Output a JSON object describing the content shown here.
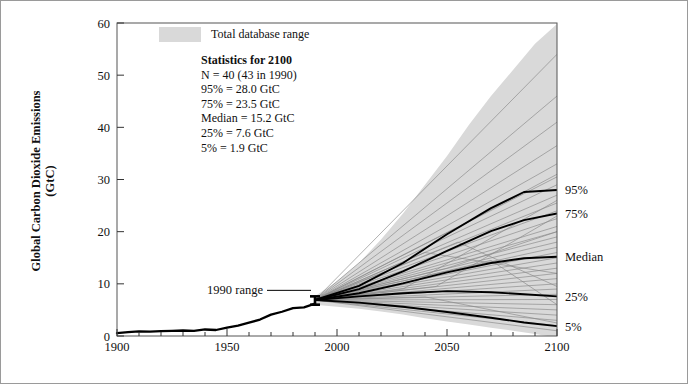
{
  "figure": {
    "name": "global-co2-emissions-scenarios",
    "background": "#ffffff",
    "border_color": "#9a9a9a"
  },
  "legend": {
    "swatch_color": "#d9d9d9",
    "label": "Total database range"
  },
  "stats_box": {
    "heading": "Statistics for 2100",
    "lines": [
      "N = 40  (43 in 1990)",
      "95% = 28.0 GtC",
      "75% = 23.5 GtC",
      "Median = 15.2 GtC",
      "25% = 7.6 GtC",
      "5% = 1.9 GtC"
    ]
  },
  "annotations": [
    {
      "name": "range-1990",
      "text": "1990 range",
      "x_year": 1990,
      "y_low": 6.0,
      "y_high": 7.6
    }
  ],
  "right_labels": [
    {
      "name": "label-95",
      "text": "95%",
      "value": 28.0
    },
    {
      "name": "label-75",
      "text": "75%",
      "value": 23.5
    },
    {
      "name": "label-median",
      "text": "Median",
      "value": 15.2
    },
    {
      "name": "label-25",
      "text": "25%",
      "value": 7.6
    },
    {
      "name": "label-5",
      "text": "5%",
      "value": 1.9
    }
  ],
  "chart_data": {
    "type": "line",
    "title": "",
    "xlabel": "",
    "ylabel_line1": "Global Carbon Dioxide Emissions",
    "ylabel_line2": "(GtC)",
    "xlim": [
      1900,
      2100
    ],
    "ylim": [
      0,
      60
    ],
    "xticks": [
      1900,
      1950,
      2000,
      2050,
      2100
    ],
    "xticks_minor_step": 10,
    "yticks": [
      0,
      10,
      20,
      30,
      40,
      50,
      60
    ],
    "grid": false,
    "legend_position": "top-left-inside",
    "colors": {
      "range_band": "#d9d9d9",
      "historical": "#000000",
      "percentile": "#000000",
      "scenario": "#8a8a8a"
    },
    "series": [
      {
        "name": "Historical emissions",
        "style": "bold-black",
        "x": [
          1900,
          1905,
          1910,
          1915,
          1920,
          1925,
          1930,
          1935,
          1940,
          1945,
          1950,
          1955,
          1960,
          1965,
          1970,
          1975,
          1980,
          1985,
          1990
        ],
        "values": [
          0.55,
          0.75,
          0.88,
          0.85,
          0.95,
          1.0,
          1.05,
          1.0,
          1.25,
          1.15,
          1.6,
          2.0,
          2.55,
          3.15,
          4.1,
          4.65,
          5.35,
          5.5,
          6.2
        ]
      },
      {
        "name": "Total database range upper envelope",
        "style": "band-upper",
        "x": [
          1990,
          2000,
          2010,
          2020,
          2030,
          2040,
          2050,
          2060,
          2070,
          2080,
          2090,
          2100
        ],
        "values": [
          7.6,
          10.5,
          14.0,
          18.5,
          23.5,
          29.0,
          34.5,
          40.5,
          46.0,
          51.0,
          56.0,
          59.8
        ]
      },
      {
        "name": "Total database range lower envelope",
        "style": "band-lower",
        "x": [
          1990,
          2000,
          2010,
          2020,
          2030,
          2040,
          2050,
          2060,
          2070,
          2080,
          2090,
          2100
        ],
        "values": [
          6.0,
          5.6,
          5.2,
          4.7,
          4.1,
          3.4,
          2.8,
          2.2,
          1.6,
          1.0,
          0.4,
          -0.3
        ]
      },
      {
        "name": "95th percentile",
        "style": "bold-black",
        "x": [
          1990,
          2010,
          2030,
          2050,
          2070,
          2085,
          2100
        ],
        "values": [
          6.9,
          9.6,
          14.0,
          19.5,
          24.5,
          27.6,
          28.0
        ]
      },
      {
        "name": "75th percentile",
        "style": "bold-black",
        "x": [
          1990,
          2010,
          2030,
          2050,
          2070,
          2085,
          2100
        ],
        "values": [
          6.9,
          9.0,
          12.4,
          16.3,
          20.1,
          22.2,
          23.5
        ]
      },
      {
        "name": "Median",
        "style": "bold-black",
        "x": [
          1990,
          2010,
          2030,
          2050,
          2070,
          2085,
          2100
        ],
        "values": [
          6.9,
          8.2,
          10.1,
          12.2,
          14.0,
          14.9,
          15.2
        ]
      },
      {
        "name": "25th percentile",
        "style": "bold-black",
        "x": [
          1990,
          2010,
          2030,
          2050,
          2070,
          2085,
          2100
        ],
        "values": [
          6.9,
          7.6,
          8.2,
          8.6,
          8.4,
          8.0,
          7.6
        ]
      },
      {
        "name": "5th percentile",
        "style": "bold-black",
        "x": [
          1990,
          2010,
          2030,
          2050,
          2070,
          2085,
          2100
        ],
        "values": [
          6.9,
          6.4,
          5.6,
          4.6,
          3.5,
          2.6,
          1.9
        ]
      },
      {
        "name": "Scenario 01",
        "style": "thin-gray",
        "x": [
          1990,
          2100
        ],
        "values": [
          6.9,
          54.0
        ]
      },
      {
        "name": "Scenario 02",
        "style": "thin-gray",
        "x": [
          1990,
          2100
        ],
        "values": [
          6.9,
          46.0
        ]
      },
      {
        "name": "Scenario 03",
        "style": "thin-gray",
        "x": [
          1990,
          2100
        ],
        "values": [
          6.9,
          41.0
        ]
      },
      {
        "name": "Scenario 04",
        "style": "thin-gray",
        "x": [
          1990,
          2100
        ],
        "values": [
          6.9,
          36.5
        ]
      },
      {
        "name": "Scenario 05",
        "style": "thin-gray",
        "x": [
          1990,
          2100
        ],
        "values": [
          6.9,
          33.0
        ]
      },
      {
        "name": "Scenario 06",
        "style": "thin-gray",
        "x": [
          1990,
          2100
        ],
        "values": [
          6.9,
          30.5
        ]
      },
      {
        "name": "Scenario 07",
        "style": "thin-gray",
        "x": [
          1990,
          2100
        ],
        "values": [
          6.9,
          29.0
        ]
      },
      {
        "name": "Scenario 08",
        "style": "thin-gray",
        "x": [
          1990,
          2100
        ],
        "values": [
          6.9,
          27.0
        ]
      },
      {
        "name": "Scenario 09",
        "style": "thin-gray",
        "x": [
          1990,
          2100
        ],
        "values": [
          6.9,
          25.5
        ]
      },
      {
        "name": "Scenario 10",
        "style": "thin-gray",
        "x": [
          1990,
          2100
        ],
        "values": [
          6.9,
          24.0
        ]
      },
      {
        "name": "Scenario 11",
        "style": "thin-gray",
        "x": [
          1990,
          2100
        ],
        "values": [
          6.9,
          22.5
        ]
      },
      {
        "name": "Scenario 12",
        "style": "thin-gray",
        "x": [
          1990,
          2100
        ],
        "values": [
          6.9,
          21.0
        ]
      },
      {
        "name": "Scenario 13",
        "style": "thin-gray",
        "x": [
          1990,
          2100
        ],
        "values": [
          6.9,
          20.0
        ]
      },
      {
        "name": "Scenario 14",
        "style": "thin-gray",
        "x": [
          1990,
          2100
        ],
        "values": [
          6.9,
          19.0
        ]
      },
      {
        "name": "Scenario 15",
        "style": "thin-gray",
        "x": [
          1990,
          2100
        ],
        "values": [
          6.9,
          18.0
        ]
      },
      {
        "name": "Scenario 16",
        "style": "thin-gray",
        "x": [
          1990,
          2100
        ],
        "values": [
          6.9,
          17.0
        ]
      },
      {
        "name": "Scenario 17",
        "style": "thin-gray",
        "x": [
          1990,
          2100
        ],
        "values": [
          6.9,
          16.0
        ]
      },
      {
        "name": "Scenario 18",
        "style": "thin-gray",
        "x": [
          1990,
          2100
        ],
        "values": [
          6.9,
          15.0
        ]
      },
      {
        "name": "Scenario 19",
        "style": "thin-gray",
        "x": [
          1990,
          2100
        ],
        "values": [
          6.9,
          14.0
        ]
      },
      {
        "name": "Scenario 20",
        "style": "thin-gray",
        "x": [
          1990,
          2100
        ],
        "values": [
          6.9,
          13.0
        ]
      },
      {
        "name": "Scenario 21",
        "style": "thin-gray",
        "x": [
          1990,
          2100
        ],
        "values": [
          6.9,
          12.0
        ]
      },
      {
        "name": "Scenario 22",
        "style": "thin-gray",
        "x": [
          1990,
          2100
        ],
        "values": [
          6.9,
          11.0
        ]
      },
      {
        "name": "Scenario 23",
        "style": "thin-gray",
        "x": [
          1990,
          2100
        ],
        "values": [
          6.9,
          10.0
        ]
      },
      {
        "name": "Scenario 24",
        "style": "thin-gray",
        "x": [
          1990,
          2100
        ],
        "values": [
          6.9,
          9.0
        ]
      },
      {
        "name": "Scenario 25",
        "style": "thin-gray",
        "x": [
          1990,
          2100
        ],
        "values": [
          6.9,
          8.0
        ]
      },
      {
        "name": "Scenario 26",
        "style": "thin-gray",
        "x": [
          1990,
          2100
        ],
        "values": [
          6.9,
          7.0
        ]
      },
      {
        "name": "Scenario 27",
        "style": "thin-gray",
        "x": [
          1990,
          2100
        ],
        "values": [
          6.9,
          6.0
        ]
      },
      {
        "name": "Scenario 28",
        "style": "thin-gray",
        "x": [
          1990,
          2100
        ],
        "values": [
          6.9,
          5.0
        ]
      },
      {
        "name": "Scenario 29",
        "style": "thin-gray",
        "x": [
          1990,
          2100
        ],
        "values": [
          6.9,
          4.0
        ]
      },
      {
        "name": "Scenario 30",
        "style": "thin-gray",
        "x": [
          1990,
          2100
        ],
        "values": [
          6.9,
          3.0
        ]
      },
      {
        "name": "Scenario 31",
        "style": "thin-gray",
        "x": [
          1990,
          2100
        ],
        "values": [
          6.9,
          2.0
        ]
      },
      {
        "name": "Scenario 32",
        "style": "thin-gray",
        "x": [
          1990,
          2100
        ],
        "values": [
          6.9,
          1.0
        ]
      },
      {
        "name": "Scenario 33",
        "style": "thin-gray",
        "x": [
          1990,
          2040,
          2100
        ],
        "values": [
          6.9,
          16.0,
          12.0
        ]
      },
      {
        "name": "Scenario 34",
        "style": "thin-gray",
        "x": [
          1990,
          2050,
          2100
        ],
        "values": [
          6.9,
          13.0,
          20.0
        ]
      },
      {
        "name": "Scenario 35",
        "style": "thin-gray",
        "x": [
          1990,
          2045,
          2100
        ],
        "values": [
          6.9,
          9.5,
          23.0
        ]
      },
      {
        "name": "Scenario 36",
        "style": "thin-gray",
        "x": [
          1990,
          2055,
          2100
        ],
        "values": [
          6.9,
          18.0,
          9.5
        ]
      },
      {
        "name": "Scenario 37",
        "style": "thin-gray",
        "x": [
          1990,
          2035,
          2070,
          2100
        ],
        "values": [
          6.9,
          11.0,
          14.5,
          6.0
        ]
      },
      {
        "name": "Scenario 38",
        "style": "thin-gray",
        "x": [
          1990,
          2030,
          2075,
          2100
        ],
        "values": [
          6.9,
          9.0,
          20.0,
          26.0
        ]
      },
      {
        "name": "Scenario 39",
        "style": "thin-gray",
        "x": [
          1990,
          2060,
          2100
        ],
        "values": [
          6.9,
          22.0,
          31.0
        ]
      },
      {
        "name": "Scenario 40",
        "style": "thin-gray",
        "x": [
          1990,
          2040,
          2100
        ],
        "values": [
          6.9,
          7.5,
          2.5
        ]
      }
    ]
  }
}
